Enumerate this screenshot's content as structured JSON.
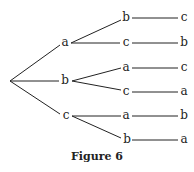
{
  "figure": {
    "caption": "Figure 6",
    "level1": [
      "a",
      "b",
      "c"
    ],
    "level2": [
      "b",
      "c",
      "a",
      "c",
      "a",
      "b"
    ],
    "level3": [
      "c",
      "b",
      "c",
      "a",
      "b",
      "a"
    ]
  }
}
